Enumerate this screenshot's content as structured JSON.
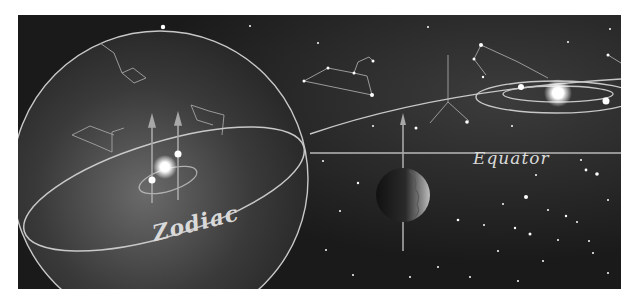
{
  "figure": {
    "labels": {
      "zodiac": "Zodiac",
      "equator": "Equator"
    },
    "colors": {
      "background": "#1a1a1a",
      "lines": "#c8c8c8",
      "stars": "#ffffff",
      "page": "#ffffff"
    },
    "elements": {
      "celestial_sphere": "celestial-sphere",
      "zodiac_ring": "zodiac-ellipse",
      "equator_line": "equator-line",
      "earth": "earth-planet",
      "sun_inside_sphere": "sun-with-orbit",
      "sun_distant": "sun-with-orbits-right",
      "axes": "rotation-axis-arrows",
      "constellations": "constellation-lines"
    }
  }
}
